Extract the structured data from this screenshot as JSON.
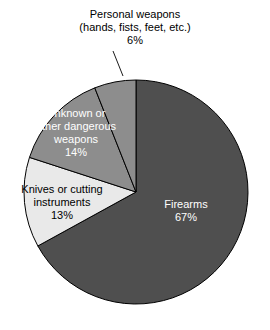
{
  "chart_data": {
    "type": "pie",
    "title": "",
    "subtitle": "",
    "xlabel": "",
    "ylabel": "",
    "legend_position": "none",
    "grid": false,
    "start_angle_deg": 0,
    "direction": "clockwise",
    "categories": [
      "Firearms",
      "Knives or cutting instruments",
      "Unknown or other dangerous weapons",
      "Personal weapons (hands, fists, feet, etc.)"
    ],
    "values": [
      67,
      13,
      14,
      6
    ],
    "value_unit": "%",
    "slices": [
      {
        "name": "Firearms",
        "label": "Firearms",
        "value": 67,
        "value_text": "67%",
        "color": "#4f4f4f",
        "text_color": "#ffffff",
        "label_placement": "inside"
      },
      {
        "name": "Knives or cutting instruments",
        "label": "Knives or cutting\ninstruments",
        "value": 13,
        "value_text": "13%",
        "color": "#e9e9e9",
        "text_color": "#000000",
        "label_placement": "inside"
      },
      {
        "name": "Unknown or other dangerous weapons",
        "label": "Unknown or\nother dangerous\nweapons",
        "value": 14,
        "value_text": "14%",
        "color": "#8d8d8d",
        "text_color": "#ffffff",
        "label_placement": "inside"
      },
      {
        "name": "Personal weapons",
        "label": "Personal weapons\n(hands, fists, feet, etc.)",
        "value": 6,
        "value_text": "6%",
        "color": "#8d8d8d",
        "text_color": "#000000",
        "label_placement": "callout"
      }
    ],
    "outline_color": "#000000"
  },
  "labels": {
    "personal_weapons": "Personal weapons\n(hands, fists, feet, etc.)\n6%",
    "firearms": "Firearms\n67%",
    "unknown_weapons": "Unknown or\nother dangerous\nweapons\n14%",
    "knives": "Knives or cutting\ninstruments\n13%"
  }
}
